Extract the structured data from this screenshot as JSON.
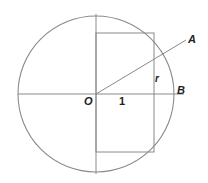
{
  "figure": {
    "name": "circle-with-inscribed-rectangle",
    "background_color": "#ffffff",
    "stroke_color": "#8a8a8a",
    "label_color": "#222222",
    "labels": {
      "center": "O",
      "unit": "1",
      "radius_segment": "r",
      "point_a": "A",
      "point_b": "B"
    },
    "geometry": {
      "circle": {
        "cx": 96,
        "cy": 94,
        "r": 78
      },
      "horizontal_diameter": {
        "x1": 18,
        "y1": 94,
        "x2": 184,
        "y2": 94
      },
      "vertical_diameter": {
        "x1": 96,
        "y1": 14,
        "x2": 96,
        "y2": 174
      },
      "rectangle": {
        "x": 96,
        "y": 33,
        "width": 58,
        "height": 119
      },
      "radius_line_to_A": {
        "x1": 96,
        "y1": 94,
        "x2": 186,
        "y2": 40
      }
    }
  }
}
